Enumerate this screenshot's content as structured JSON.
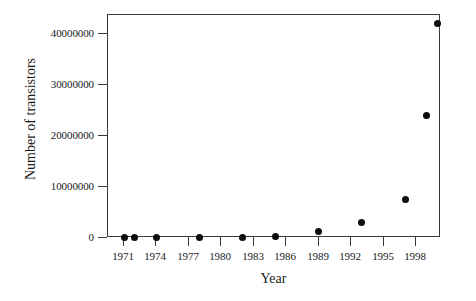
{
  "chart_data": {
    "type": "scatter",
    "title": "",
    "xlabel": "Year",
    "ylabel": "Number of transistors",
    "xlim": [
      1969.5,
      2000.5
    ],
    "ylim": [
      0,
      43000000
    ],
    "grid": false,
    "legend": null,
    "xticks": [
      1971,
      1974,
      1977,
      1980,
      1983,
      1986,
      1989,
      1992,
      1995,
      1998
    ],
    "xtick_labels": [
      "1971",
      "1974",
      "1977",
      "1980",
      "1983",
      "1986",
      "1989",
      "1992",
      "1995",
      "1998"
    ],
    "yticks": [
      0,
      10000000,
      20000000,
      30000000,
      40000000
    ],
    "ytick_labels": [
      "0",
      "10000000",
      "20000000",
      "30000000",
      "40000000"
    ],
    "marker": "filled-circle",
    "marker_color": "#0d0d0d",
    "x": [
      1971,
      1972,
      1974,
      1978,
      1982,
      1985,
      1989,
      1993,
      1997,
      1999,
      2000
    ],
    "y": [
      2300,
      3500,
      6000,
      29000,
      134000,
      275000,
      1180000,
      3100000,
      7500000,
      24000000,
      42000000
    ],
    "points": [
      {
        "year": 1971,
        "transistors": 2300
      },
      {
        "year": 1972,
        "transistors": 3500
      },
      {
        "year": 1974,
        "transistors": 6000
      },
      {
        "year": 1978,
        "transistors": 29000
      },
      {
        "year": 1982,
        "transistors": 134000
      },
      {
        "year": 1985,
        "transistors": 275000
      },
      {
        "year": 1989,
        "transistors": 1180000
      },
      {
        "year": 1993,
        "transistors": 3100000
      },
      {
        "year": 1997,
        "transistors": 7500000
      },
      {
        "year": 1999,
        "transistors": 24000000
      },
      {
        "year": 2000,
        "transistors": 42000000
      }
    ]
  },
  "colors": {
    "axis": "#3a3a3a",
    "marker": "#0d0d0d",
    "background": "#ffffff",
    "text": "#1a1a1a"
  }
}
